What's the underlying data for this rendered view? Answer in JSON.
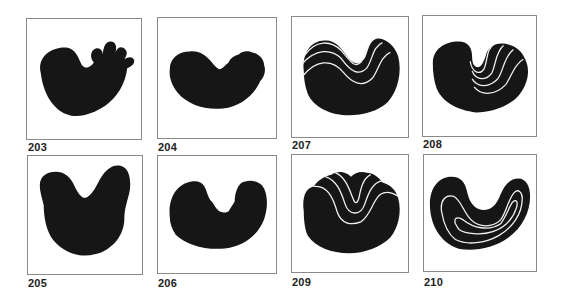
{
  "figure": {
    "fill_color": "#161616",
    "line_color": "#f2f2f2",
    "border_color": "#8a8a8a",
    "panels": [
      {
        "id": "203",
        "label": "203",
        "description": "Kidney-shaped solid form with five finger-like lobes on upper right"
      },
      {
        "id": "204",
        "label": "204",
        "description": "Crescent/bean-shaped solid form with slightly scalloped upper edge"
      },
      {
        "id": "207",
        "label": "207",
        "description": "Bean-shaped solid form with three parallel wavy white lines across top"
      },
      {
        "id": "208",
        "label": "208",
        "description": "Bean-shaped solid form with four white curved lines in upper-right lobe"
      },
      {
        "id": "205",
        "label": "205",
        "description": "Heart/U-shaped solid form with two rounded upper lobes"
      },
      {
        "id": "206",
        "label": "206",
        "description": "U-shaped solid form with jagged inner notch"
      },
      {
        "id": "209",
        "label": "209",
        "description": "Rounded solid form with nested U-shaped white folds converging at center"
      },
      {
        "id": "210",
        "label": "210",
        "description": "U-shaped solid form with two concentric white U-lines inside"
      }
    ]
  }
}
